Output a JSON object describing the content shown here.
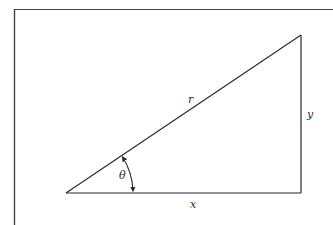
{
  "diagram": {
    "type": "right-triangle",
    "colors": {
      "stroke": "#2b2b2b",
      "frame": "#444444",
      "background": "#ffffff"
    },
    "labels": {
      "hypotenuse": "r",
      "opposite": "y",
      "adjacent": "x",
      "angle": "θ"
    }
  }
}
